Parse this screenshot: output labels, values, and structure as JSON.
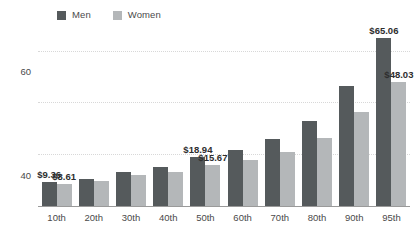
{
  "chart_data": {
    "type": "bar",
    "title": "",
    "xlabel": "",
    "ylabel": "",
    "ylim": [
      0,
      68
    ],
    "yticks": [
      0,
      20,
      40,
      60
    ],
    "grid": true,
    "legend_position": "top",
    "categories": [
      "10th",
      "20th",
      "30th",
      "40th",
      "50th",
      "60th",
      "70th",
      "80th",
      "90th",
      "95th"
    ],
    "series": [
      {
        "name": "Men",
        "color": "#555a5c",
        "values": [
          9.36,
          10.6,
          13.2,
          15.1,
          18.94,
          21.5,
          25.8,
          33.0,
          46.5,
          65.06
        ]
      },
      {
        "name": "Women",
        "color": "#b4b7b9",
        "values": [
          8.61,
          9.8,
          11.8,
          13.0,
          15.67,
          17.8,
          21.0,
          26.3,
          36.3,
          48.03
        ]
      }
    ],
    "point_labels": [
      {
        "series": "Men",
        "category": "10th",
        "text": "$9.36"
      },
      {
        "series": "Women",
        "category": "10th",
        "text": "$8.61"
      },
      {
        "series": "Men",
        "category": "50th",
        "text": "$18.94"
      },
      {
        "series": "Women",
        "category": "50th",
        "text": "$15.67"
      },
      {
        "series": "Men",
        "category": "95th",
        "text": "$65.06"
      },
      {
        "series": "Women",
        "category": "95th",
        "text": "$48.03"
      }
    ]
  },
  "legend": {
    "items": [
      {
        "label": "Men",
        "color": "#555a5c"
      },
      {
        "label": "Women",
        "color": "#b4b7b9"
      }
    ]
  },
  "axis": {
    "y": {
      "ticks": [
        "0",
        "20",
        "40",
        "60"
      ]
    },
    "x": {
      "ticks": [
        "10th",
        "20th",
        "30th",
        "40th",
        "50th",
        "60th",
        "70th",
        "80th",
        "90th",
        "95th"
      ]
    }
  }
}
